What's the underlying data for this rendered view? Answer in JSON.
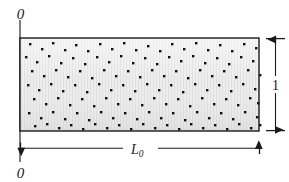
{
  "figure": {
    "type": "technical-diagram",
    "background_color": "#ffffff",
    "labels": {
      "origin_top": "0",
      "origin_bottom": "0",
      "height_dimension": "1",
      "length_dimension_base": "L",
      "length_dimension_subscript": "0"
    },
    "icon_names": {
      "datum_line": "vertical-datum-line",
      "height_dimension_arrow": "vertical-double-arrow-icon",
      "length_dimension_arrow": "horizontal-double-arrow-icon",
      "specimen": "hatched-rectangle-specimen"
    },
    "specimen": {
      "x": 20,
      "y": 38,
      "width": 239,
      "height": 93,
      "fill_color": "#e9e9e9",
      "stroke_color": "#1a1a1a",
      "stroke_width": 1.4,
      "texture": "fine vertical stripes",
      "particle_color": "#101010",
      "particle_size": 2.4,
      "particle_count": 150
    },
    "datum": {
      "x": 20,
      "y_top": 20,
      "y_bottom": 162,
      "color": "#3a3a3a",
      "width": 1.3
    },
    "height_dimension": {
      "x": 275,
      "y_top": 38,
      "y_bottom": 131,
      "tick_x1": 266,
      "tick_x2": 285,
      "color": "#1a1a1a"
    },
    "length_dimension": {
      "y": 148,
      "x_left": 20,
      "x_right": 259,
      "tick_height": 11,
      "color": "#1a1a1a"
    },
    "particles": [
      [
        6,
        4
      ],
      [
        18,
        9
      ],
      [
        29,
        3
      ],
      [
        41,
        10
      ],
      [
        52,
        5
      ],
      [
        64,
        11
      ],
      [
        76,
        4
      ],
      [
        88,
        9
      ],
      [
        100,
        3
      ],
      [
        112,
        10
      ],
      [
        124,
        6
      ],
      [
        136,
        11
      ],
      [
        148,
        4
      ],
      [
        160,
        9
      ],
      [
        172,
        3
      ],
      [
        184,
        10
      ],
      [
        196,
        5
      ],
      [
        208,
        11
      ],
      [
        220,
        4
      ],
      [
        232,
        8
      ],
      [
        2,
        17
      ],
      [
        13,
        22
      ],
      [
        25,
        16
      ],
      [
        37,
        23
      ],
      [
        49,
        18
      ],
      [
        61,
        24
      ],
      [
        73,
        17
      ],
      [
        85,
        22
      ],
      [
        97,
        16
      ],
      [
        109,
        23
      ],
      [
        121,
        18
      ],
      [
        133,
        24
      ],
      [
        145,
        17
      ],
      [
        157,
        21
      ],
      [
        169,
        16
      ],
      [
        181,
        23
      ],
      [
        193,
        18
      ],
      [
        205,
        24
      ],
      [
        217,
        17
      ],
      [
        229,
        21
      ],
      [
        8,
        31
      ],
      [
        20,
        36
      ],
      [
        32,
        30
      ],
      [
        44,
        37
      ],
      [
        56,
        31
      ],
      [
        68,
        38
      ],
      [
        80,
        30
      ],
      [
        92,
        36
      ],
      [
        104,
        31
      ],
      [
        116,
        37
      ],
      [
        128,
        30
      ],
      [
        140,
        36
      ],
      [
        152,
        31
      ],
      [
        164,
        38
      ],
      [
        176,
        30
      ],
      [
        188,
        36
      ],
      [
        200,
        31
      ],
      [
        212,
        37
      ],
      [
        224,
        30
      ],
      [
        236,
        35
      ],
      [
        4,
        45
      ],
      [
        15,
        50
      ],
      [
        27,
        44
      ],
      [
        39,
        51
      ],
      [
        51,
        45
      ],
      [
        63,
        52
      ],
      [
        75,
        44
      ],
      [
        87,
        50
      ],
      [
        99,
        45
      ],
      [
        111,
        51
      ],
      [
        123,
        44
      ],
      [
        135,
        50
      ],
      [
        147,
        45
      ],
      [
        159,
        52
      ],
      [
        171,
        44
      ],
      [
        183,
        50
      ],
      [
        195,
        45
      ],
      [
        207,
        51
      ],
      [
        219,
        44
      ],
      [
        231,
        49
      ],
      [
        10,
        59
      ],
      [
        22,
        64
      ],
      [
        34,
        58
      ],
      [
        46,
        65
      ],
      [
        58,
        59
      ],
      [
        70,
        66
      ],
      [
        82,
        58
      ],
      [
        94,
        64
      ],
      [
        106,
        59
      ],
      [
        118,
        65
      ],
      [
        130,
        58
      ],
      [
        142,
        64
      ],
      [
        154,
        59
      ],
      [
        166,
        66
      ],
      [
        178,
        58
      ],
      [
        190,
        64
      ],
      [
        202,
        59
      ],
      [
        214,
        65
      ],
      [
        226,
        58
      ],
      [
        234,
        63
      ],
      [
        5,
        73
      ],
      [
        17,
        78
      ],
      [
        29,
        72
      ],
      [
        41,
        79
      ],
      [
        53,
        73
      ],
      [
        65,
        80
      ],
      [
        77,
        72
      ],
      [
        89,
        78
      ],
      [
        101,
        73
      ],
      [
        113,
        79
      ],
      [
        125,
        72
      ],
      [
        137,
        78
      ],
      [
        149,
        73
      ],
      [
        161,
        80
      ],
      [
        173,
        72
      ],
      [
        185,
        78
      ],
      [
        197,
        73
      ],
      [
        209,
        79
      ],
      [
        221,
        72
      ],
      [
        233,
        77
      ],
      [
        11,
        86
      ],
      [
        23,
        84
      ],
      [
        35,
        88
      ],
      [
        47,
        85
      ],
      [
        59,
        89
      ],
      [
        71,
        84
      ],
      [
        83,
        88
      ],
      [
        95,
        85
      ],
      [
        107,
        89
      ],
      [
        119,
        84
      ],
      [
        131,
        88
      ],
      [
        143,
        85
      ],
      [
        155,
        89
      ],
      [
        167,
        84
      ],
      [
        179,
        88
      ],
      [
        191,
        85
      ],
      [
        203,
        89
      ],
      [
        215,
        84
      ],
      [
        227,
        88
      ],
      [
        236,
        85
      ]
    ]
  }
}
